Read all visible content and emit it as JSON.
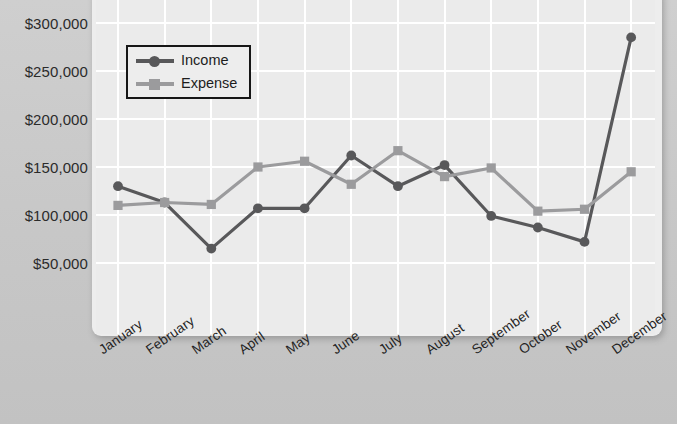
{
  "chart_data": {
    "type": "line",
    "title": "",
    "xlabel": "",
    "ylabel": "",
    "categories": [
      "January",
      "February",
      "March",
      "April",
      "May",
      "June",
      "July",
      "August",
      "September",
      "October",
      "November",
      "December"
    ],
    "series": [
      {
        "name": "Income",
        "color": "#58585a",
        "marker": "circle",
        "values": [
          130000,
          113000,
          65000,
          107000,
          107000,
          162000,
          130000,
          152000,
          99000,
          87000,
          72000,
          285000
        ]
      },
      {
        "name": "Expense",
        "color": "#9b9b9d",
        "marker": "square",
        "values": [
          110000,
          113000,
          111000,
          150000,
          156000,
          132000,
          167000,
          140000,
          149000,
          104000,
          106000,
          145000
        ]
      }
    ],
    "ylim": [
      25000,
      300000
    ],
    "yticks": [
      300000,
      250000,
      200000,
      150000,
      100000,
      50000
    ],
    "ytick_labels": [
      "$300,000",
      "$250,000",
      "$200,000",
      "$150,000",
      "$100,000",
      "$50,000"
    ],
    "grid": "both",
    "legend_position": "top-left",
    "note_top_cropped": true
  },
  "legend": {
    "items": [
      {
        "label": "Income"
      },
      {
        "label": "Expense"
      }
    ]
  },
  "colors": {
    "income": "#58585a",
    "expense": "#9b9b9d",
    "plot_background": "#ebebeb",
    "canvas_background": "#c8c8c8",
    "gridline": "#ffffff",
    "axis_text": "#232323"
  }
}
